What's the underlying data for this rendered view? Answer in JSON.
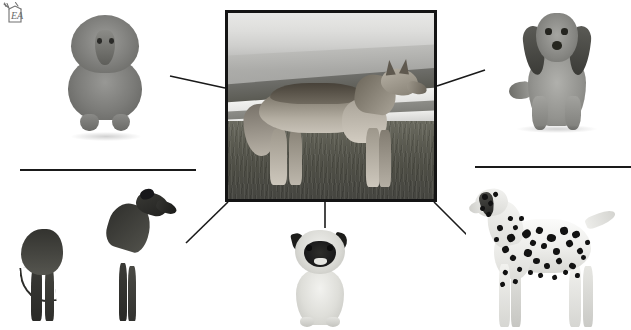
{
  "canvas": {
    "width": 631,
    "height": 330,
    "background_color": "#ffffff",
    "title": "Wolf and domestic dog breeds radial relationship diagram"
  },
  "watermark": {
    "name": "watermark-logo",
    "text": "EA",
    "description": "small hand-drawn sketch logo with letters EA in top-left corner",
    "color": "#3a3a3a"
  },
  "center": {
    "label": "Wolf",
    "caption": "",
    "image_description": "Grayscale photograph of a standing wolf in profile facing right, on grassy tundra with a lake and distant mountain ridge behind",
    "frame": {
      "border_color": "#141414",
      "border_width_px": 3,
      "x": 225,
      "y": 10,
      "width": 212,
      "height": 192
    }
  },
  "breeds": [
    {
      "id": "poodle",
      "label": "Poodle",
      "position": "top-left",
      "image_description": "Grayscale photograph of a standard poodle sitting upright and facing forward, with a thick curly coat",
      "x": 60,
      "y": 12,
      "width": 92,
      "height": 132
    },
    {
      "id": "dachshund",
      "label": "Dachshund",
      "position": "top-right",
      "image_description": "Grayscale photograph of a long-haired dachshund lying down and facing forward, with long dark drop ears",
      "x": 505,
      "y": 8,
      "width": 104,
      "height": 128
    },
    {
      "id": "greyhound",
      "label": "Greyhound",
      "position": "bottom-left",
      "image_description": "Grayscale photograph of a dark greyhound standing in profile facing right, with a deep chest and tucked abdomen",
      "x": 18,
      "y": 188,
      "width": 160,
      "height": 136
    },
    {
      "id": "pug",
      "label": "Pug",
      "position": "bottom-center",
      "image_description": "Grayscale photograph of a fawn pug sitting and facing forward, with a dark muzzle mask and wrinkled face",
      "x": 278,
      "y": 228,
      "width": 84,
      "height": 100
    },
    {
      "id": "dalmatian",
      "label": "Dalmatian",
      "position": "bottom-right",
      "image_description": "Grayscale photograph of a spotted dalmatian standing in profile facing left",
      "x": 466,
      "y": 180,
      "width": 156,
      "height": 150
    }
  ],
  "connectors": {
    "color": "#1a1a1a",
    "width_px": 1.6,
    "lines": [
      {
        "id": "center-to-poodle",
        "x1": 170,
        "y1": 76,
        "x2": 225,
        "y2": 88,
        "description": "line from centre frame left edge up toward the poodle"
      },
      {
        "id": "center-to-dachshund",
        "x1": 437,
        "y1": 86,
        "x2": 485,
        "y2": 70,
        "description": "line from centre frame right edge up toward the dachshund"
      },
      {
        "id": "center-to-greyhound",
        "x1": 186,
        "y1": 243,
        "x2": 228,
        "y2": 202,
        "description": "diagonal line from centre frame bottom-left corner down to the greyhound"
      },
      {
        "id": "center-to-pug",
        "x1": 325,
        "y1": 202,
        "x2": 325,
        "y2": 232,
        "description": "short vertical line from centre frame bottom down to the pug"
      },
      {
        "id": "center-to-dalmatian",
        "x1": 434,
        "y1": 202,
        "x2": 474,
        "y2": 242,
        "description": "diagonal line from centre frame bottom-right corner down to the dalmatian"
      }
    ],
    "rules": [
      {
        "id": "left-rule",
        "x1": 20,
        "y1": 170,
        "x2": 196,
        "y2": 170,
        "description": "horizontal rule on the left side"
      },
      {
        "id": "right-rule",
        "x1": 475,
        "y1": 167,
        "x2": 631,
        "y2": 167,
        "description": "horizontal rule on the right side"
      }
    ]
  }
}
